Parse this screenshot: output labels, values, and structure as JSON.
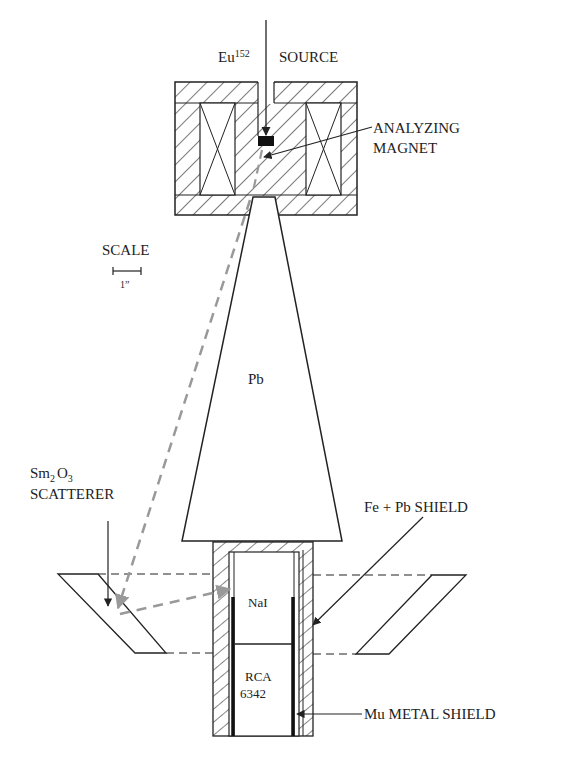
{
  "diagram": {
    "labels": {
      "source_element": "Eu",
      "source_isotope": "152",
      "source_word": "SOURCE",
      "magnet_line1": "ANALYZING",
      "magnet_line2": "MAGNET",
      "scale_title": "SCALE",
      "scale_unit": "1”",
      "cone_material": "Pb",
      "scatterer_sm": "Sm",
      "scatterer_sub2": "2",
      "scatterer_o": "O",
      "scatterer_sub3": "3",
      "scatterer_word": "SCATTERER",
      "shield_fe_pb": "Fe + Pb SHIELD",
      "crystal": "NaI",
      "pmt_line1": "RCA",
      "pmt_line2": "6342",
      "mu_metal": "Mu METAL SHIELD"
    },
    "colors": {
      "line": "#222222",
      "ray": "#999999",
      "source_block": "#111111"
    }
  }
}
